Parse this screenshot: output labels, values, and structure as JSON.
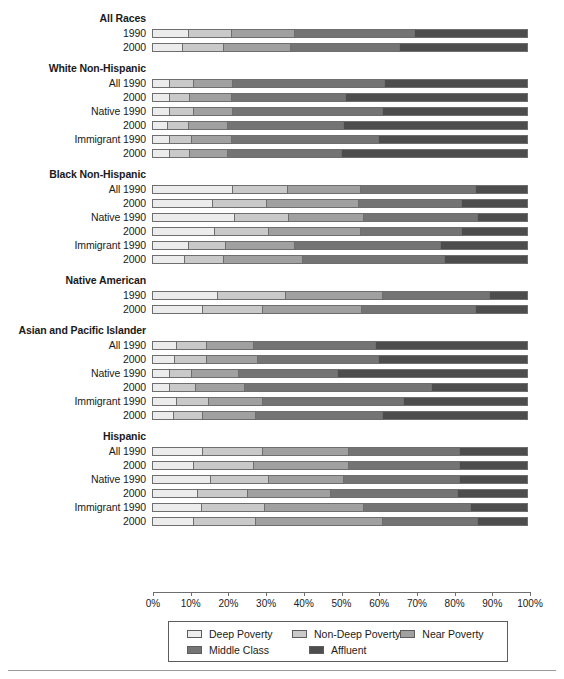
{
  "chart_data": {
    "type": "bar",
    "orientation": "horizontal",
    "stacked": true,
    "normalized": true,
    "title": "",
    "subtitle": "",
    "xlabel": "",
    "ylabel": "",
    "xlim": [
      0,
      100
    ],
    "grid": false,
    "legend_position": "bottom",
    "series": [
      {
        "name": "Deep Poverty",
        "color": "#ececec"
      },
      {
        "name": "Non-Deep Poverty",
        "color": "#c9c9c9"
      },
      {
        "name": "Near Poverty",
        "color": "#a0a0a0"
      },
      {
        "name": "Middle Class",
        "color": "#747474"
      },
      {
        "name": "Affluent",
        "color": "#4d4d4d"
      }
    ],
    "xticks": [
      {
        "value": 0,
        "label": "0%"
      },
      {
        "value": 10,
        "label": "10%"
      },
      {
        "value": 20,
        "label": "20%"
      },
      {
        "value": 30,
        "label": "30%"
      },
      {
        "value": 40,
        "label": "40%"
      },
      {
        "value": 50,
        "label": "50%"
      },
      {
        "value": 60,
        "label": "60%"
      },
      {
        "value": 70,
        "label": "70%"
      },
      {
        "value": 80,
        "label": "80%"
      },
      {
        "value": 90,
        "label": "90%"
      },
      {
        "value": 100,
        "label": "100%"
      }
    ],
    "groups": [
      {
        "header": "All Races",
        "rows": [
          {
            "label": "1990",
            "values": [
              9.5,
              11.5,
              17.0,
              32.0,
              30.0
            ]
          },
          {
            "label": "2000",
            "values": [
              8.0,
              11.0,
              18.0,
              29.0,
              34.0
            ]
          }
        ]
      },
      {
        "header": "White Non-Hispanic",
        "rows": [
          {
            "label": "All 1990",
            "values": [
              4.5,
              6.5,
              10.5,
              40.5,
              38.0
            ]
          },
          {
            "label": "2000",
            "values": [
              4.5,
              5.5,
              11.0,
              30.5,
              48.5
            ]
          },
          {
            "label": "Native 1990",
            "values": [
              4.5,
              6.5,
              10.5,
              40.0,
              38.5
            ]
          },
          {
            "label": "2000",
            "values": [
              4.0,
              5.5,
              10.5,
              31.0,
              49.0
            ]
          },
          {
            "label": "Immigrant 1990",
            "values": [
              4.5,
              6.0,
              10.5,
              39.5,
              39.5
            ]
          },
          {
            "label": "2000",
            "values": [
              4.5,
              5.5,
              10.0,
              30.5,
              49.5
            ]
          }
        ]
      },
      {
        "header": "Black Non-Hispanic",
        "rows": [
          {
            "label": "All 1990",
            "values": [
              21.5,
              14.5,
              19.5,
              31.0,
              13.5
            ]
          },
          {
            "label": "2000",
            "values": [
              16.0,
              14.5,
              24.5,
              27.5,
              17.5
            ]
          },
          {
            "label": "Native 1990",
            "values": [
              22.0,
              14.5,
              20.0,
              30.5,
              13.0
            ]
          },
          {
            "label": "2000",
            "values": [
              16.5,
              14.5,
              24.5,
              27.0,
              17.5
            ]
          },
          {
            "label": "Immigrant 1990",
            "values": [
              9.5,
              10.0,
              18.5,
              39.0,
              23.0
            ]
          },
          {
            "label": "2000",
            "values": [
              8.5,
              10.5,
              21.0,
              38.0,
              22.0
            ]
          }
        ]
      },
      {
        "header": "Native American",
        "rows": [
          {
            "label": "1990",
            "values": [
              17.5,
              18.0,
              26.0,
              28.5,
              10.0
            ]
          },
          {
            "label": "2000",
            "values": [
              13.5,
              16.0,
              26.5,
              30.5,
              13.5
            ]
          }
        ]
      },
      {
        "header": "Asian and Pacific Islander",
        "rows": [
          {
            "label": "All 1990",
            "values": [
              6.5,
              8.0,
              12.5,
              32.5,
              40.5
            ]
          },
          {
            "label": "2000",
            "values": [
              6.0,
              8.5,
              13.5,
              32.5,
              39.5
            ]
          },
          {
            "label": "Native 1990",
            "values": [
              4.5,
              6.0,
              12.5,
              26.5,
              50.5
            ]
          },
          {
            "label": "2000",
            "values": [
              4.5,
              7.0,
              13.0,
              50.0,
              25.5
            ]
          },
          {
            "label": "Immigrant 1990",
            "values": [
              6.5,
              8.5,
              14.5,
              37.5,
              33.0
            ]
          },
          {
            "label": "2000",
            "values": [
              5.5,
              8.0,
              14.0,
              34.0,
              38.5
            ]
          }
        ]
      },
      {
        "header": "Hispanic",
        "rows": [
          {
            "label": "All 1990",
            "values": [
              13.5,
              16.0,
              23.0,
              29.5,
              18.0
            ]
          },
          {
            "label": "2000",
            "values": [
              11.0,
              16.0,
              25.5,
              29.5,
              18.0
            ]
          },
          {
            "label": "Native 1990",
            "values": [
              15.5,
              15.5,
              20.0,
              31.0,
              18.0
            ]
          },
          {
            "label": "2000",
            "values": [
              12.0,
              13.5,
              22.0,
              34.0,
              18.5
            ]
          },
          {
            "label": "Immigrant 1990",
            "values": [
              13.0,
              17.0,
              26.5,
              28.5,
              15.0
            ]
          },
          {
            "label": "2000",
            "values": [
              11.0,
              16.5,
              34.0,
              25.5,
              13.0
            ]
          }
        ]
      }
    ]
  },
  "legend": {
    "items": [
      {
        "label": "Deep Poverty",
        "color": "#ececec"
      },
      {
        "label": "Non-Deep Poverty",
        "color": "#c9c9c9"
      },
      {
        "label": "Near Poverty",
        "color": "#a0a0a0"
      },
      {
        "label": "Middle Class",
        "color": "#747474"
      },
      {
        "label": "Affluent",
        "color": "#4d4d4d"
      }
    ]
  }
}
